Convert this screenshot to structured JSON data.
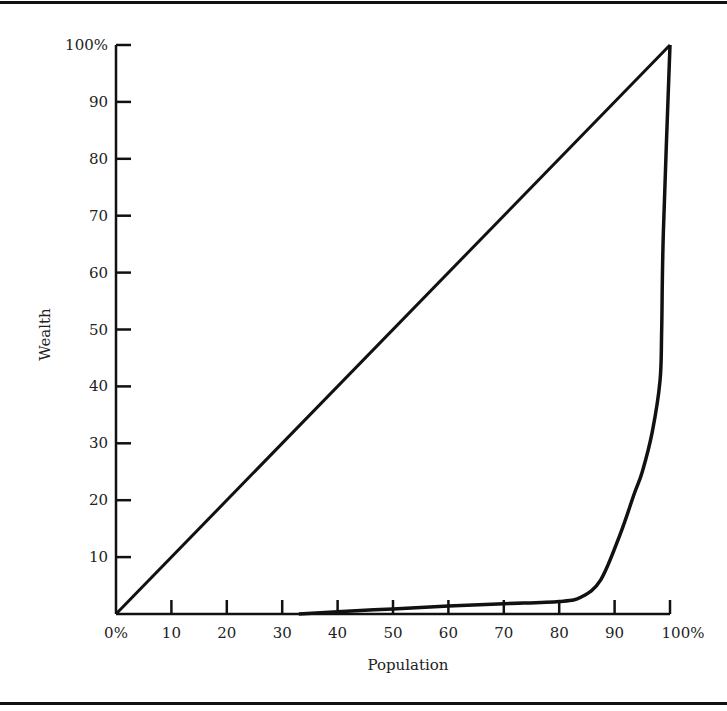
{
  "chart_data": {
    "type": "line",
    "title": "",
    "xlabel": "Population",
    "ylabel": "Wealth",
    "xlim": [
      0,
      100
    ],
    "ylim": [
      0,
      100
    ],
    "grid": false,
    "x_ticks": [
      0,
      10,
      20,
      30,
      40,
      50,
      60,
      70,
      80,
      90,
      100
    ],
    "x_tick_labels": [
      "0%",
      "10",
      "20",
      "30",
      "40",
      "50",
      "60",
      "70",
      "80",
      "90",
      "100%"
    ],
    "y_ticks": [
      10,
      20,
      30,
      40,
      50,
      60,
      70,
      80,
      90,
      100
    ],
    "y_tick_labels": [
      "10",
      "20",
      "30",
      "40",
      "50",
      "60",
      "70",
      "80",
      "90",
      "100%"
    ],
    "series": [
      {
        "name": "Line of equality",
        "x": [
          0,
          100
        ],
        "y": [
          0,
          100
        ]
      },
      {
        "name": "Lorenz curve",
        "x": [
          33,
          40,
          50,
          60,
          70,
          80,
          84,
          87.5,
          91,
          93.5,
          95,
          96.8,
          98.2,
          98.5,
          98.8,
          100
        ],
        "y": [
          0,
          0.4,
          0.9,
          1.4,
          1.8,
          2.2,
          3,
          6,
          14,
          21,
          25,
          32,
          41,
          50,
          67,
          100
        ]
      }
    ]
  }
}
